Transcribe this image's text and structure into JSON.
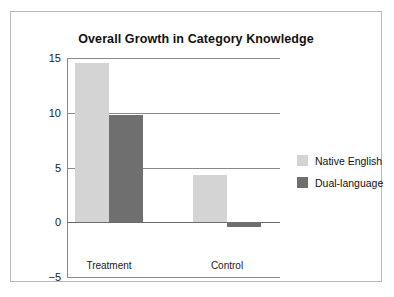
{
  "chart_data": {
    "type": "bar",
    "title": "Overall Growth in Category Knowledge",
    "xlabel": "",
    "ylabel": "",
    "categories": [
      "Treatment",
      "Control"
    ],
    "series": [
      {
        "name": "Native English",
        "color": "#d4d4d4",
        "values": [
          14.5,
          4.3
        ]
      },
      {
        "name": "Dual-language",
        "color": "#6f6f6f",
        "values": [
          9.8,
          -0.4
        ]
      }
    ],
    "ylim": [
      -5,
      15
    ],
    "yticks": [
      15,
      10,
      5,
      0,
      -5
    ],
    "ytick_labels": [
      "15",
      "10",
      "5",
      "0",
      "−5"
    ],
    "grid": true,
    "grid_axis": "y",
    "legend_position": "right",
    "background": "#ffffff",
    "frame_color": "#b9b9b9",
    "axis_color": "#8a8a8a"
  }
}
